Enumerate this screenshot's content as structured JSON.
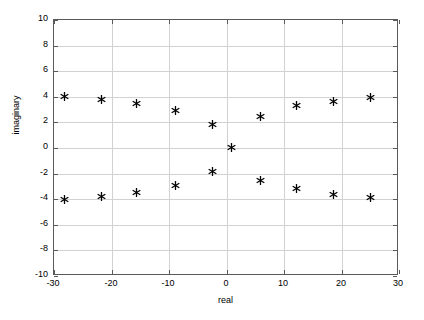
{
  "chart_data": {
    "type": "scatter",
    "title": "",
    "xlabel": "real",
    "ylabel": "imaginary",
    "xlim": [
      -30,
      30
    ],
    "ylim": [
      -10,
      10
    ],
    "xticks": [
      -30,
      -20,
      -10,
      0,
      10,
      20,
      30
    ],
    "xtick_labels": [
      "-30",
      "-20",
      "-10",
      "0",
      "10",
      "20",
      "30"
    ],
    "yticks": [
      -10,
      -8,
      -6,
      -4,
      -2,
      0,
      2,
      4,
      6,
      8,
      10
    ],
    "ytick_labels": [
      "-10",
      "-8",
      "-6",
      "-4",
      "-2",
      "0",
      "2",
      "4",
      "6",
      "8",
      "10"
    ],
    "grid": true,
    "legend": "none",
    "marker": "star",
    "marker_color": "#000000",
    "grid_color": "#d2d2d2",
    "axis_color": "#5a5a5a",
    "background_color": "#ffffff",
    "series": [
      {
        "name": "poles",
        "points": [
          {
            "x": -28.2,
            "y": 4.05
          },
          {
            "x": -21.8,
            "y": 3.8
          },
          {
            "x": -15.7,
            "y": 3.45
          },
          {
            "x": -8.9,
            "y": 2.95
          },
          {
            "x": -2.4,
            "y": 1.8
          },
          {
            "x": 0.8,
            "y": 0.02
          },
          {
            "x": 5.9,
            "y": 2.5
          },
          {
            "x": 12.2,
            "y": 3.3
          },
          {
            "x": 18.6,
            "y": 3.65
          },
          {
            "x": 25.0,
            "y": 3.95
          },
          {
            "x": -28.2,
            "y": -4.05
          },
          {
            "x": -21.8,
            "y": -3.8
          },
          {
            "x": -15.7,
            "y": -3.45
          },
          {
            "x": -8.9,
            "y": -2.95
          },
          {
            "x": -2.4,
            "y": -1.8
          },
          {
            "x": 5.9,
            "y": -2.5
          },
          {
            "x": 12.2,
            "y": -3.2
          },
          {
            "x": 18.6,
            "y": -3.6
          },
          {
            "x": 25.0,
            "y": -3.9
          }
        ]
      }
    ]
  }
}
